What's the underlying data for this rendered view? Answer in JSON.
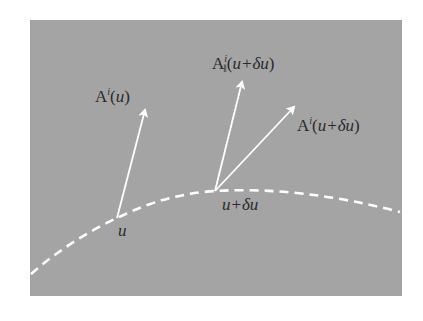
{
  "diagram": {
    "type": "parallel-transport-illustration",
    "colors": {
      "background": "#ffffff",
      "panel": "#a4a4a4",
      "stroke": "#ffffff",
      "text": "#2a2a2a"
    },
    "panel": {
      "x": 30,
      "y": 20,
      "width": 372,
      "height": 276
    },
    "curve": {
      "style": "dashed",
      "path": "M 31 274 Q 70 240 117 218 Q 165 194 215 191 Q 300 186 400 212"
    },
    "points": [
      {
        "id": "p1",
        "x": 117,
        "y": 218,
        "label": "u"
      },
      {
        "id": "p2",
        "x": 215,
        "y": 191,
        "label": "u+δu"
      }
    ],
    "vectors": [
      {
        "id": "A_at_u",
        "from": [
          117,
          218
        ],
        "to": [
          145,
          108
        ],
        "label_base": "A",
        "label_sup": "i",
        "label_sub": "",
        "label_arg": "u"
      },
      {
        "id": "A_parallel_at_u_du",
        "from": [
          215,
          191
        ],
        "to": [
          243,
          80
        ],
        "label_base": "A",
        "label_sup": "i",
        "label_sub": "∥",
        "label_arg": "u+δu"
      },
      {
        "id": "A_at_u_du",
        "from": [
          215,
          191
        ],
        "to": [
          296,
          105
        ],
        "label_base": "A",
        "label_sup": "i",
        "label_sub": "",
        "label_arg": "u+δu"
      }
    ]
  },
  "labels": {
    "vec1": {
      "base": "A",
      "sup": "i",
      "open": "(",
      "arg": "u",
      "close": ")"
    },
    "vec2": {
      "base": "A",
      "sup": "i",
      "sub": "∥",
      "open": "(",
      "arg": "u+δu",
      "close": ")"
    },
    "vec3": {
      "base": "A",
      "sup": "i",
      "open": "(",
      "arg": "u+δu",
      "close": ")"
    },
    "point1": "u",
    "point2": "u+δu"
  }
}
